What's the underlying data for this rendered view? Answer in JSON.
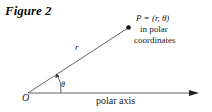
{
  "figure": {
    "title": "Figure 2"
  },
  "diagram": {
    "origin_label": "O",
    "radius_label": "r",
    "angle_label": "θ",
    "point_label_line1": "P = (r, θ)",
    "point_label_line2": "in polar",
    "point_label_line3": "coordinates",
    "axis_label": "polar axis",
    "colors": {
      "line": "#555555",
      "point": "#111111",
      "text": "#222222"
    }
  }
}
